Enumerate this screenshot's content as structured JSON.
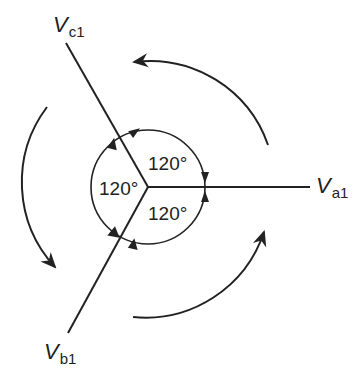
{
  "diagram": {
    "type": "phasor diagram",
    "phasors": [
      {
        "id": "a",
        "symbol": "V",
        "subscript": "a1",
        "angle_deg": 0
      },
      {
        "id": "b",
        "symbol": "V",
        "subscript": "b1",
        "angle_deg": -120
      },
      {
        "id": "c",
        "symbol": "V",
        "subscript": "c1",
        "angle_deg": 120
      }
    ],
    "angles": [
      {
        "between": "a-c",
        "label": "120°"
      },
      {
        "between": "c-b",
        "label": "120°"
      },
      {
        "between": "b-a",
        "label": "120°"
      }
    ],
    "rotation": "counterclockwise",
    "colors": {
      "line": "#222222",
      "background": "#ffffff"
    }
  }
}
